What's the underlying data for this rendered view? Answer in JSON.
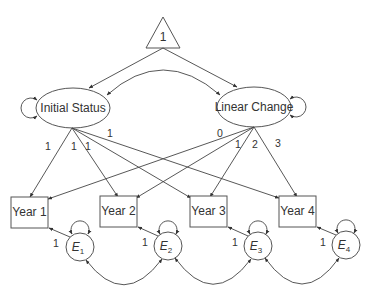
{
  "diagram": {
    "type": "latent growth curve model (path diagram)",
    "constant": {
      "label": "1",
      "shape": "triangle"
    },
    "latent_factors": [
      {
        "id": "initial_status",
        "label": "Initial Status",
        "shape": "ellipse",
        "has_variance_loop": true
      },
      {
        "id": "linear_change",
        "label": "Linear Change",
        "shape": "ellipse",
        "has_variance_loop": true
      }
    ],
    "latent_covariance": {
      "from": "initial_status",
      "to": "linear_change",
      "type": "double-headed curved arrow"
    },
    "observed": [
      {
        "id": "year1",
        "label": "Year 1"
      },
      {
        "id": "year2",
        "label": "Year 2"
      },
      {
        "id": "year3",
        "label": "Year 3"
      },
      {
        "id": "year4",
        "label": "Year 4"
      }
    ],
    "errors": [
      {
        "id": "e1",
        "label": "E",
        "sub": "1",
        "loading": "1"
      },
      {
        "id": "e2",
        "label": "E",
        "sub": "2",
        "loading": "1"
      },
      {
        "id": "e3",
        "label": "E",
        "sub": "3",
        "loading": "1"
      },
      {
        "id": "e4",
        "label": "E",
        "sub": "4",
        "loading": "1"
      }
    ],
    "loadings": {
      "initial_status": [
        "1",
        "1",
        "1",
        "1"
      ],
      "linear_change": [
        "0",
        "1",
        "2",
        "3"
      ]
    },
    "error_covariances": [
      {
        "from": "e1",
        "to": "e2"
      },
      {
        "from": "e2",
        "to": "e3"
      },
      {
        "from": "e3",
        "to": "e4"
      }
    ]
  }
}
